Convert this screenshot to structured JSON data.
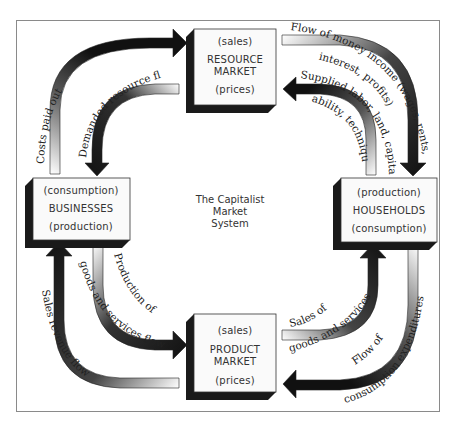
{
  "diagram": {
    "title": "The Capitalist Market System",
    "title_lines": [
      "The Capitalist",
      "Market",
      "System"
    ],
    "colors": {
      "background": "#ffffff",
      "frame": "#8a8a8a",
      "box_face": "#fafafa",
      "box_shadow": "#1a1a1a",
      "arrow_dark": "#111111",
      "arrow_light": "#ffffff"
    },
    "nodes": {
      "resource_market": {
        "top": "(sales)",
        "name_lines": [
          "RESOURCE",
          "MARKET"
        ],
        "bottom": "(prices)"
      },
      "businesses": {
        "top": "(consumption)",
        "name": "BUSINESSES",
        "bottom": "(production)"
      },
      "households": {
        "top": "(production)",
        "name": "HOUSEHOLDS",
        "bottom": "(consumption)"
      },
      "product_market": {
        "top": "(sales)",
        "name_lines": [
          "PRODUCT",
          "MARKET"
        ],
        "bottom": "(prices)"
      }
    },
    "flows": [
      {
        "id": "costs_paid_out",
        "from": "businesses",
        "to": "resource_market",
        "label": "Costs paid out"
      },
      {
        "id": "demanded_resource_flows",
        "from": "resource_market",
        "to": "businesses",
        "label": "Demanded resource flows"
      },
      {
        "id": "money_income",
        "from": "resource_market",
        "to": "households",
        "label_lines": [
          "Flow of money income (wages, rents,",
          "interest, profits)"
        ]
      },
      {
        "id": "supplied_resources",
        "from": "households",
        "to": "resource_market",
        "label_lines": [
          "Supplied labor, land, capital,",
          "ability, technique"
        ]
      },
      {
        "id": "production_flow",
        "from": "businesses",
        "to": "product_market",
        "label_lines": [
          "Production of",
          "goods and services flow"
        ]
      },
      {
        "id": "sales_revenue",
        "from": "product_market",
        "to": "businesses",
        "label": "Sales revenue flow"
      },
      {
        "id": "sales_goods",
        "from": "product_market",
        "to": "households",
        "label_lines": [
          "Sales of",
          "goods and services"
        ]
      },
      {
        "id": "consumption_expenditures",
        "from": "households",
        "to": "product_market",
        "label_lines": [
          "Flow of",
          "consumption expenditures"
        ]
      }
    ]
  }
}
